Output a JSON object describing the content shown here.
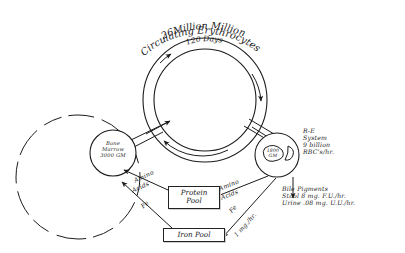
{
  "diagram": {
    "ink_color": "#1c1c1c",
    "background_color": "#ffffff",
    "curved_text": {
      "outer_top": "26Million Million",
      "outer_bottom": "Circulating Erythrocytes",
      "inner": "120 Days"
    },
    "nodes": {
      "bone_marrow": {
        "line1": "Bone",
        "line2": "Marrow",
        "line3": "3000 GM"
      },
      "re_organ": {
        "line1": "1800",
        "line2": "GM"
      }
    },
    "pools": {
      "protein": {
        "line1": "Protein",
        "line2": "Pool"
      },
      "iron": {
        "line1": "Iron Pool"
      }
    },
    "annotations": {
      "re_system": {
        "line1": "R-E",
        "line2": "System",
        "line3": "9 billion",
        "line4": "RBC's/hr."
      },
      "bile": {
        "line1": "Bile Pigments",
        "line2": "Stool 8 mg. F.U./hr.",
        "line3": "Urine .08 mg. U.U./hr."
      }
    },
    "edge_labels": {
      "amino_left_1": "Amino",
      "amino_left_2": "Acids",
      "fe_left": "Fe",
      "amino_right_1": "Amino",
      "amino_right_2": "Acids",
      "fe_right": "Fe",
      "fe_rate": "1 mg./hr."
    }
  }
}
